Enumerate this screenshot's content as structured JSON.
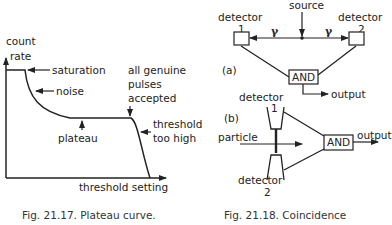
{
  "figure_left": {
    "caption": "Fig. 21.17.  Plateau curve.",
    "y_axis_label_line1": "count",
    "y_axis_label_line2": "rate",
    "x_axis_label": "threshold setting",
    "annotations": {
      "saturation": "saturation",
      "noise": "noise",
      "plateau": "plateau",
      "accepted_line1": "all genuine",
      "accepted_line2": "pulses",
      "accepted_line3": "accepted",
      "too_high_line1": "threshold",
      "too_high_line2": "too high"
    }
  },
  "figure_right": {
    "caption": "Fig. 21.18.  Coincidence",
    "part_a": {
      "label": "(a)",
      "source": "source",
      "detector1_line1": "detector",
      "detector1_line2": "1",
      "detector2_line1": "detector",
      "detector2_line2": "2",
      "gamma_left": "γ",
      "gamma_right": "γ",
      "gate": "AND",
      "output": "output"
    },
    "part_b": {
      "label": "(b)",
      "detector1_line1": "detector",
      "detector1_line2": "1",
      "detector2_line1": "detector",
      "detector2_line2": "2",
      "particle": "particle",
      "gate": "AND",
      "output": "output"
    }
  },
  "colors": {
    "ink": "#222222",
    "background": "#ffffff"
  }
}
